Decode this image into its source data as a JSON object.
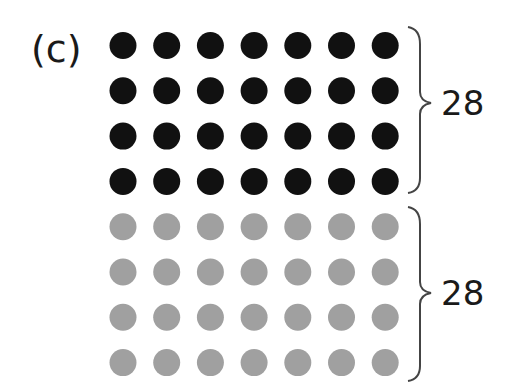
{
  "part_label": "(c)",
  "groups": [
    {
      "name": "top",
      "color": "#111111",
      "rows": 4,
      "cols": 7,
      "count_label": "28"
    },
    {
      "name": "bottom",
      "color": "#a0a0a0",
      "rows": 4,
      "cols": 7,
      "count_label": "28"
    }
  ],
  "colors": {
    "dark_dot": "#111111",
    "gray_dot": "#a0a0a0",
    "brace": "#444444",
    "text": "#1a1a1a"
  }
}
